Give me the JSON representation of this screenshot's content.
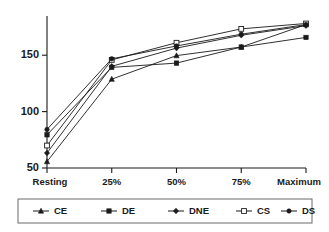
{
  "chart_data": {
    "type": "line",
    "title": "",
    "subtitle": "",
    "xlabel": "",
    "ylabel": "",
    "categories": [
      "Resting",
      "25%",
      "50%",
      "75%",
      "Maximum"
    ],
    "ylim": [
      50,
      192
    ],
    "xlim": [
      0,
      4
    ],
    "yticks": [
      50,
      100,
      150
    ],
    "ytick_labels": [
      "50",
      "100",
      "150"
    ],
    "grid": false,
    "legend_position": "bottom",
    "series": [
      {
        "name": "CE",
        "marker": "triangle-filled",
        "values": [
          56,
          133,
          155,
          163,
          184
        ]
      },
      {
        "name": "DE",
        "marker": "square-filled",
        "values": [
          81,
          144,
          148,
          163,
          172
        ]
      },
      {
        "name": "DNE",
        "marker": "diamond-filled",
        "values": [
          64,
          145,
          162,
          174,
          183
        ]
      },
      {
        "name": "CS",
        "marker": "square-open",
        "values": [
          71,
          151,
          167,
          180,
          185
        ]
      },
      {
        "name": "DS",
        "marker": "dot-filled",
        "values": [
          86,
          152,
          164,
          175,
          184
        ]
      }
    ]
  },
  "legend": {
    "entries": [
      {
        "label": "CE"
      },
      {
        "label": "DE"
      },
      {
        "label": "DNE"
      },
      {
        "label": "CS"
      },
      {
        "label": "DS"
      }
    ]
  },
  "axes": {
    "y_tick_labels": [
      "150",
      "100",
      "50"
    ],
    "x_tick_labels": [
      "Resting",
      "25%",
      "50%",
      "75%",
      "Maximum"
    ]
  },
  "colors": {
    "ink": "#1a1a1a",
    "legend_border": "#6b6b6b",
    "background": "#ffffff",
    "marker_open_fill": "#ffffff"
  }
}
